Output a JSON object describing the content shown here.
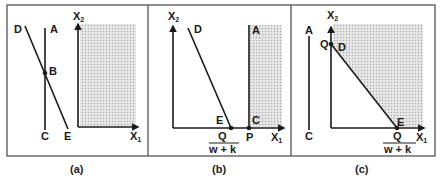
{
  "figure": {
    "colors": {
      "line": "#1a1a1a",
      "frame": "#555555",
      "shade": "#d4d4d4",
      "background": "#ffffff"
    },
    "panels": [
      {
        "id": "a",
        "caption": "(a)",
        "axis_x_label": "X",
        "axis_x_sub": "1",
        "axis_y_label": "X",
        "axis_y_sub": "2",
        "points": {
          "A": "A",
          "B": "B",
          "C": "C",
          "D": "D",
          "E": "E"
        }
      },
      {
        "id": "b",
        "caption": "(b)",
        "axis_x_label": "X",
        "axis_x_sub": "1",
        "axis_y_label": "X",
        "axis_y_sub": "2",
        "points": {
          "A": "A",
          "C": "C",
          "D": "D",
          "E": "E",
          "P": "P"
        },
        "fraction_numerator": "Q",
        "fraction_denominator": "w + k"
      },
      {
        "id": "c",
        "caption": "(c)",
        "axis_x_label": "X",
        "axis_x_sub": "1",
        "axis_y_label": "X",
        "axis_y_sub": "2",
        "points": {
          "A": "A",
          "C": "C",
          "D": "D",
          "E": "E",
          "Q": "Q"
        },
        "fraction_numerator": "Q",
        "fraction_denominator": "w + k"
      }
    ]
  }
}
